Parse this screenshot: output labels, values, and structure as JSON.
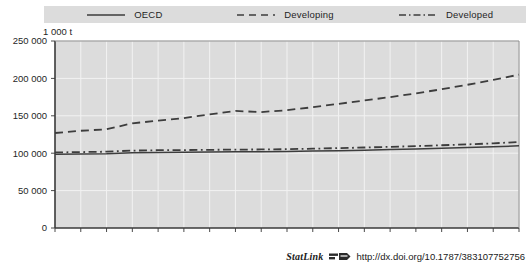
{
  "unit_label": "1 000 t",
  "legend": {
    "position": "top",
    "items": [
      {
        "label": "OECD",
        "style": "solid",
        "icon": "solid-line-icon",
        "color": "#3d3d3d"
      },
      {
        "label": "Developing",
        "style": "dashed",
        "icon": "dashed-line-icon",
        "color": "#3d3d3d"
      },
      {
        "label": "Developed",
        "style": "dash-dot",
        "icon": "dash-dot-line-icon",
        "color": "#3d3d3d"
      }
    ]
  },
  "source": {
    "statlink_label": "StatLink",
    "statlink_icon": "statlink-glyph-icon",
    "url": "http://dx.doi.org/10.1787/383107752756"
  },
  "chart_data": {
    "type": "line",
    "title": "",
    "xlabel": "",
    "ylabel": "1 000 t",
    "grid": true,
    "legend_position": "top",
    "x": [
      1999,
      2000,
      2001,
      2002,
      2003,
      2004,
      2005,
      2006,
      2007,
      2008,
      2009,
      2010,
      2011,
      2012,
      2013,
      2014,
      2015,
      2016,
      2017
    ],
    "xtick_labels": [
      "1999",
      "2000",
      "2001",
      "2002",
      "2003",
      "2004",
      "2005",
      "2006",
      "2007",
      "2008",
      "2009",
      "2010",
      "2011",
      "2012",
      "2013",
      "2014",
      "2015",
      "2016",
      "2017"
    ],
    "ytick_labels": [
      "0",
      "50 000",
      "100 000",
      "150 000",
      "200 000",
      "250 000"
    ],
    "yticks": [
      0,
      50000,
      100000,
      150000,
      200000,
      250000
    ],
    "ylim": [
      0,
      250000
    ],
    "xlim": [
      1999,
      2017
    ],
    "series": [
      {
        "name": "OECD",
        "style": "solid",
        "color": "#3d3d3d",
        "values": [
          98500,
          98800,
          99200,
          100500,
          101000,
          101200,
          101500,
          101800,
          102000,
          102300,
          102800,
          103400,
          104000,
          104800,
          105600,
          106500,
          107500,
          108600,
          109800
        ]
      },
      {
        "name": "Developing",
        "style": "dashed",
        "color": "#3d3d3d",
        "values": [
          127000,
          130000,
          132000,
          140000,
          143500,
          147000,
          152000,
          156500,
          155000,
          157500,
          161500,
          166000,
          170500,
          175000,
          180000,
          185500,
          191500,
          198000,
          205000
        ]
      },
      {
        "name": "Developed",
        "style": "dash-dot",
        "color": "#3d3d3d",
        "values": [
          101000,
          101500,
          102000,
          103500,
          104000,
          104200,
          104500,
          104800,
          105000,
          105400,
          106000,
          106800,
          107600,
          108500,
          109500,
          110600,
          111800,
          113200,
          115000
        ]
      }
    ]
  }
}
